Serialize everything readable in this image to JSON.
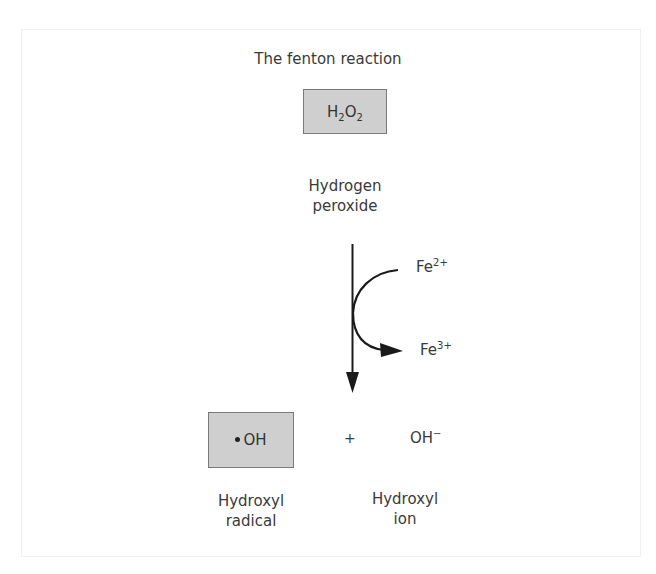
{
  "diagram": {
    "title": "The fenton reaction",
    "reactant": {
      "formula_parts": [
        "H",
        "2",
        "O",
        "2"
      ],
      "name_line1": "Hydrogen",
      "name_line2": "peroxide"
    },
    "catalyst": {
      "input": {
        "base": "Fe",
        "charge": "2+"
      },
      "output": {
        "base": "Fe",
        "charge": "3+"
      }
    },
    "products": [
      {
        "formula": "OH",
        "radical_dot": true,
        "name_line1": "Hydroxyl",
        "name_line2": "radical",
        "boxed": true
      },
      {
        "formula": "OH",
        "charge": "−",
        "name_line1": "Hydroxyl",
        "name_line2": "ion",
        "boxed": false
      }
    ],
    "operator": "+",
    "colors": {
      "box_fill": "#cfcfcf",
      "box_border": "#7a7a7a",
      "text": "#3a3a3a",
      "arrow": "#1a1a1a"
    }
  }
}
